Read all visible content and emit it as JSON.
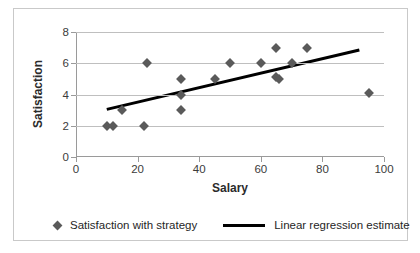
{
  "chart_data": {
    "type": "scatter",
    "title": "",
    "xlabel": "Salary",
    "ylabel": "Satisfaction",
    "xlim": [
      0,
      100
    ],
    "ylim": [
      0,
      8
    ],
    "xticks": [
      0,
      20,
      40,
      60,
      80,
      100
    ],
    "yticks": [
      0,
      2,
      4,
      6,
      8
    ],
    "grid": "horizontal",
    "legend_position": "bottom",
    "series": [
      {
        "name": "Satisfaction with strategy",
        "type": "scatter",
        "marker": "diamond",
        "color": "#5a5a5a",
        "points": [
          {
            "x": 10,
            "y": 2.0
          },
          {
            "x": 12,
            "y": 2.0
          },
          {
            "x": 15,
            "y": 3.0
          },
          {
            "x": 22,
            "y": 2.0
          },
          {
            "x": 23,
            "y": 6.0
          },
          {
            "x": 34,
            "y": 5.0
          },
          {
            "x": 34,
            "y": 4.0
          },
          {
            "x": 34,
            "y": 3.0
          },
          {
            "x": 45,
            "y": 5.0
          },
          {
            "x": 50,
            "y": 6.0
          },
          {
            "x": 60,
            "y": 6.0
          },
          {
            "x": 65,
            "y": 7.0
          },
          {
            "x": 65,
            "y": 5.1
          },
          {
            "x": 66,
            "y": 5.0
          },
          {
            "x": 70,
            "y": 6.0
          },
          {
            "x": 75,
            "y": 7.0
          },
          {
            "x": 95,
            "y": 4.1
          }
        ]
      },
      {
        "name": "Linear regression estimate",
        "type": "line",
        "color": "#000000",
        "endpoints": [
          {
            "x": 10,
            "y": 3.05
          },
          {
            "x": 92,
            "y": 6.85
          }
        ]
      }
    ]
  },
  "axes": {
    "y_title": "Satisfaction",
    "x_title": "Salary",
    "y_tick_labels": [
      "0",
      "2",
      "4",
      "6",
      "8"
    ],
    "x_tick_labels": [
      "0",
      "20",
      "40",
      "60",
      "80",
      "100"
    ]
  },
  "legend": {
    "items": [
      {
        "label": "Satisfaction with strategy",
        "marker": "diamond-marker"
      },
      {
        "label": "Linear regression estimate",
        "marker": "line-swatch"
      }
    ]
  },
  "colors": {
    "marker": "#5a5a5a",
    "line": "#000000",
    "grid": "#bfbfbf",
    "axis": "#9a9a9a",
    "frame": "#c9c9c9",
    "background": "#ffffff"
  }
}
